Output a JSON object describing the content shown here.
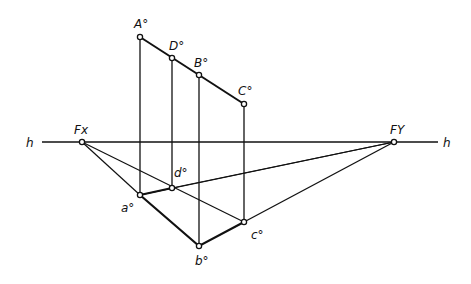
{
  "diagram": {
    "horizon": {
      "label_left": "h",
      "label_right": "h",
      "y": 142,
      "x1": 42,
      "x2": 438
    },
    "vanishing_points": [
      {
        "id": "Fx",
        "label": "Fx",
        "x": 82,
        "y": 142
      },
      {
        "id": "Fy",
        "label": "FY",
        "x": 394,
        "y": 142
      }
    ],
    "upper_points": [
      {
        "id": "A",
        "label": "A°",
        "x": 140,
        "y": 37
      },
      {
        "id": "D",
        "label": "D°",
        "x": 172,
        "y": 58
      },
      {
        "id": "B",
        "label": "B°",
        "x": 199,
        "y": 75
      },
      {
        "id": "C",
        "label": "C°",
        "x": 244,
        "y": 104
      }
    ],
    "plan_points": [
      {
        "id": "a",
        "label": "a°",
        "x": 140,
        "y": 195
      },
      {
        "id": "d",
        "label": "d°",
        "x": 172,
        "y": 188
      },
      {
        "id": "b",
        "label": "b°",
        "x": 199,
        "y": 246
      },
      {
        "id": "c",
        "label": "c°",
        "x": 244,
        "y": 222
      }
    ]
  }
}
